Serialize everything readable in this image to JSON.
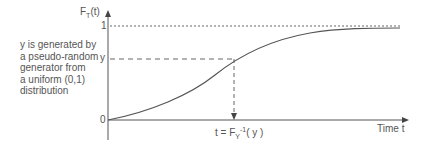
{
  "diagram": {
    "y_axis_label": "F",
    "y_axis_sub": "T",
    "y_axis_suffix": "(t)",
    "tick_one": "1",
    "tick_y": "y",
    "tick_zero": "0",
    "x_axis_label": "Time t",
    "inverse_label_prefix": "t = F",
    "inverse_sub": "Y",
    "inverse_sup": "-1",
    "inverse_suffix": "( y )",
    "description": [
      "y is generated by",
      "a pseudo-random",
      "generator from",
      "a uniform (0,1)",
      "distribution"
    ]
  },
  "colors": {
    "line": "#555555",
    "text": "#555555"
  }
}
